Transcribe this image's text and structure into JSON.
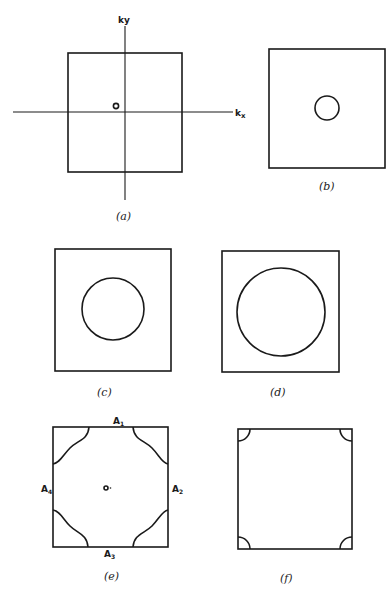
{
  "figure": {
    "panels": [
      {
        "id": "a",
        "caption": "(a)",
        "axes": {
          "x_label": "kx",
          "y_label": "ky",
          "origin_label": "o"
        },
        "contour": "small point at origin"
      },
      {
        "id": "b",
        "caption": "(b)",
        "contour": "small circle"
      },
      {
        "id": "c",
        "caption": "(c)",
        "contour": "medium circle"
      },
      {
        "id": "d",
        "caption": "(d)",
        "contour": "large circle nearly touching zone edges"
      },
      {
        "id": "e",
        "caption": "(e)",
        "origin_label": "o",
        "contour": "corner curves touching zone edges",
        "edge_labels": [
          {
            "base": "A",
            "sub": "1",
            "pos": "top"
          },
          {
            "base": "A",
            "sub": "2",
            "pos": "right"
          },
          {
            "base": "A",
            "sub": "3",
            "pos": "bottom"
          },
          {
            "base": "A",
            "sub": "4",
            "pos": "left"
          }
        ]
      },
      {
        "id": "f",
        "caption": "(f)",
        "contour": "small arcs in corners"
      }
    ]
  },
  "labels": {
    "kx": "k",
    "kx_sub": "x",
    "ky": "ky",
    "origin": "o",
    "origin_e": "o·",
    "cap_a": "(a)",
    "cap_b": "(b)",
    "cap_c": "(c)",
    "cap_d": "(d)",
    "cap_e": "(e)",
    "cap_f": "(f)",
    "A": "A",
    "s1": "1",
    "s2": "2",
    "s3": "3",
    "s4": "4"
  }
}
